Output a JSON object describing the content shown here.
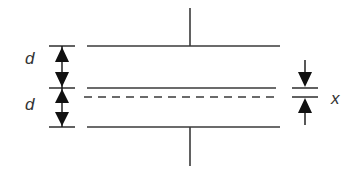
{
  "diagram": {
    "type": "capacitor-with-dielectric-slab",
    "colors": {
      "background": "#ffffff",
      "line": "#3a3a3a",
      "arrow": "#111111",
      "text": "#333333"
    },
    "plates": [
      {
        "name": "top-plate",
        "y": 46,
        "x1": 87,
        "x2": 280,
        "style": "solid"
      },
      {
        "name": "middle-plate",
        "y": 88,
        "x1": 87,
        "x2": 276,
        "style": "solid"
      },
      {
        "name": "dashed-line",
        "y": 97,
        "x1": 84,
        "x2": 277,
        "style": "dashed"
      },
      {
        "name": "bottom-plate",
        "y": 127,
        "x1": 87,
        "x2": 280,
        "style": "solid"
      }
    ],
    "leads": [
      {
        "name": "top-lead",
        "x": 190,
        "y1": 8,
        "y2": 46
      },
      {
        "name": "bottom-lead",
        "x": 190,
        "y1": 127,
        "y2": 166
      }
    ],
    "labels": {
      "d_top": "d",
      "d_bottom": "d",
      "x": "x"
    }
  }
}
